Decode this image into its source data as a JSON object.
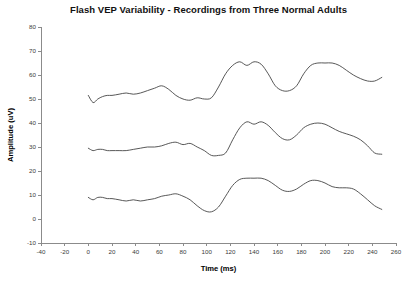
{
  "chart_data": {
    "type": "line",
    "title": "Flash VEP Variability - Recordings from Three Normal Adults",
    "xlabel": "Time (ms)",
    "ylabel": "Amplitude (uV)",
    "xlim": [
      -40,
      260
    ],
    "ylim": [
      -10,
      80
    ],
    "xticks": [
      -40,
      -20,
      0,
      20,
      40,
      60,
      80,
      100,
      120,
      140,
      160,
      180,
      200,
      220,
      240,
      260
    ],
    "yticks": [
      -10,
      0,
      10,
      20,
      30,
      40,
      50,
      60,
      70,
      80
    ],
    "grid": false,
    "legend": "none",
    "x": [
      0,
      4,
      8,
      12,
      16,
      20,
      26,
      32,
      38,
      44,
      50,
      56,
      62,
      68,
      74,
      80,
      86,
      92,
      98,
      104,
      110,
      116,
      122,
      128,
      134,
      140,
      146,
      152,
      158,
      164,
      170,
      176,
      182,
      188,
      194,
      200,
      206,
      212,
      218,
      224,
      230,
      236,
      242,
      248
    ],
    "series": [
      {
        "name": "Adult 1",
        "values": [
          51.5,
          48.5,
          50.0,
          51.0,
          51.5,
          51.5,
          52.0,
          52.5,
          52.0,
          52.5,
          53.5,
          54.5,
          55.5,
          54.0,
          51.5,
          50.0,
          49.5,
          50.5,
          50.0,
          50.5,
          55.0,
          60.5,
          64.0,
          65.5,
          64.0,
          65.5,
          64.5,
          60.5,
          55.5,
          53.5,
          53.5,
          55.5,
          60.5,
          64.0,
          65.0,
          65.0,
          65.0,
          64.0,
          62.0,
          60.0,
          58.5,
          57.5,
          57.5,
          59.0
        ]
      },
      {
        "name": "Adult 2",
        "values": [
          29.5,
          28.5,
          29.0,
          29.0,
          28.5,
          28.5,
          28.5,
          28.5,
          29.0,
          29.5,
          30.0,
          30.0,
          30.5,
          31.5,
          32.0,
          31.0,
          31.5,
          30.0,
          28.5,
          26.5,
          26.5,
          27.5,
          33.0,
          38.0,
          40.5,
          39.5,
          40.5,
          39.0,
          36.0,
          33.5,
          33.0,
          35.0,
          38.0,
          39.5,
          40.0,
          39.5,
          38.0,
          36.5,
          35.5,
          34.5,
          33.0,
          30.5,
          27.5,
          27.0
        ]
      },
      {
        "name": "Adult 3",
        "values": [
          9.0,
          8.0,
          9.0,
          9.0,
          8.5,
          8.5,
          8.0,
          7.5,
          8.0,
          7.5,
          8.0,
          8.5,
          9.5,
          10.0,
          10.5,
          9.5,
          8.0,
          5.5,
          3.5,
          3.0,
          5.0,
          9.5,
          14.0,
          16.5,
          17.0,
          17.0,
          17.0,
          16.0,
          14.0,
          12.0,
          11.5,
          12.5,
          14.5,
          16.0,
          16.0,
          15.0,
          13.5,
          13.0,
          13.0,
          12.5,
          10.5,
          8.0,
          5.5,
          4.0
        ]
      }
    ]
  }
}
